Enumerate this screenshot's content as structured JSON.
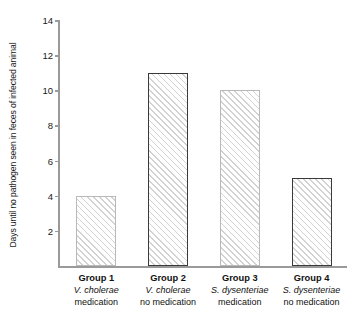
{
  "chart_data": {
    "type": "bar",
    "title": "",
    "subtitle": "",
    "xlabel": "",
    "ylabel": "Days until no pathogen seen in feces of infected animal",
    "ylim": [
      0,
      14
    ],
    "ytick_labels": [
      "14",
      "12",
      "10",
      "8",
      "6",
      "4",
      "2"
    ],
    "ytick_values": [
      14,
      12,
      10,
      8,
      6,
      4,
      2
    ],
    "grid": false,
    "legend": "none",
    "categories": [
      "Group 1 V. cholerae medication",
      "Group 2 V. cholerae no medication",
      "Group 3 S. dysenteriae medication",
      "Group 4 S. dysenteriae no medication"
    ],
    "values": [
      4,
      11,
      10,
      5
    ],
    "bars": [
      {
        "group": "Group 1",
        "species": "V. cholerae",
        "treatment": "medication",
        "value": 4,
        "edge": "light"
      },
      {
        "group": "Group 2",
        "species": "V. cholerae",
        "treatment": "no medication",
        "value": 11,
        "edge": "dark"
      },
      {
        "group": "Group 3",
        "species": "S. dysenteriae",
        "treatment": "medication",
        "value": 10,
        "edge": "light"
      },
      {
        "group": "Group 4",
        "species": "S. dysenteriae",
        "treatment": "no medication",
        "value": 5,
        "edge": "dark"
      }
    ]
  },
  "colors": {
    "axis": "#9a9a9a",
    "edge_light": "#b9b9b9",
    "edge_dark": "#3a3a3a",
    "hatch": "#d2d2d2",
    "text": "#1a1a1a",
    "background": "#ffffff"
  }
}
